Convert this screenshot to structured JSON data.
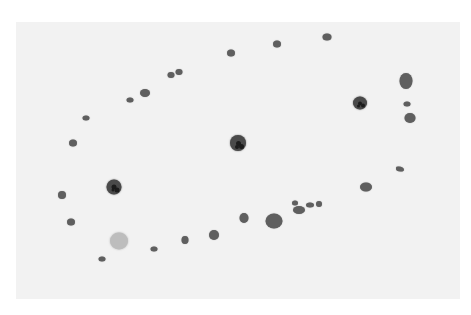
{
  "image": {
    "description": "Grayscale micrograph-style panel with scattered round cells/particles on a light gray background, surrounded by a white margin",
    "background_color": "#ffffff",
    "panel": {
      "x": 16,
      "y": 22,
      "width": 444,
      "height": 277,
      "color": "#f2f2f2"
    },
    "colors": {
      "dark_blob": "#5f5f5f",
      "nucleated_cell": "#4a4a4a",
      "nucleus": "#1c1c1c",
      "light_cell": "#bdbdbd"
    },
    "blobs": [
      {
        "x": 327,
        "y": 37,
        "w": 9,
        "h": 7,
        "kind": "dot"
      },
      {
        "x": 277,
        "y": 44,
        "w": 8,
        "h": 7,
        "kind": "dot"
      },
      {
        "x": 231,
        "y": 53,
        "w": 8,
        "h": 7,
        "kind": "dot"
      },
      {
        "x": 171,
        "y": 75,
        "w": 7,
        "h": 6,
        "kind": "dot"
      },
      {
        "x": 179,
        "y": 72,
        "w": 7,
        "h": 6,
        "kind": "dot"
      },
      {
        "x": 145,
        "y": 93,
        "w": 10,
        "h": 8,
        "kind": "dot"
      },
      {
        "x": 130,
        "y": 100,
        "w": 7,
        "h": 5,
        "kind": "dot"
      },
      {
        "x": 86,
        "y": 118,
        "w": 7,
        "h": 5,
        "kind": "dot"
      },
      {
        "x": 73,
        "y": 143,
        "w": 8,
        "h": 7,
        "kind": "dot"
      },
      {
        "x": 238,
        "y": 143,
        "w": 16,
        "h": 16,
        "kind": "nucleated"
      },
      {
        "x": 360,
        "y": 103,
        "w": 14,
        "h": 13,
        "kind": "nucleated"
      },
      {
        "x": 406,
        "y": 81,
        "w": 13,
        "h": 16,
        "kind": "dot"
      },
      {
        "x": 407,
        "y": 104,
        "w": 7,
        "h": 5,
        "kind": "dot"
      },
      {
        "x": 410,
        "y": 118,
        "w": 11,
        "h": 10,
        "kind": "dot"
      },
      {
        "x": 400,
        "y": 169,
        "w": 8,
        "h": 5,
        "kind": "triangle"
      },
      {
        "x": 366,
        "y": 187,
        "w": 12,
        "h": 9,
        "kind": "dot"
      },
      {
        "x": 114,
        "y": 187,
        "w": 15,
        "h": 15,
        "kind": "nucleated"
      },
      {
        "x": 62,
        "y": 195,
        "w": 8,
        "h": 8,
        "kind": "dot"
      },
      {
        "x": 71,
        "y": 222,
        "w": 8,
        "h": 7,
        "kind": "dot"
      },
      {
        "x": 119,
        "y": 241,
        "w": 18,
        "h": 17,
        "kind": "light"
      },
      {
        "x": 102,
        "y": 259,
        "w": 7,
        "h": 5,
        "kind": "dot"
      },
      {
        "x": 154,
        "y": 249,
        "w": 7,
        "h": 5,
        "kind": "dot"
      },
      {
        "x": 185,
        "y": 240,
        "w": 7,
        "h": 8,
        "kind": "dot"
      },
      {
        "x": 214,
        "y": 235,
        "w": 10,
        "h": 10,
        "kind": "dot"
      },
      {
        "x": 244,
        "y": 218,
        "w": 9,
        "h": 10,
        "kind": "dot"
      },
      {
        "x": 274,
        "y": 221,
        "w": 17,
        "h": 15,
        "kind": "dot"
      },
      {
        "x": 295,
        "y": 203,
        "w": 6,
        "h": 5,
        "kind": "dot"
      },
      {
        "x": 299,
        "y": 210,
        "w": 12,
        "h": 8,
        "kind": "dot"
      },
      {
        "x": 310,
        "y": 205,
        "w": 8,
        "h": 5,
        "kind": "dot"
      },
      {
        "x": 319,
        "y": 204,
        "w": 6,
        "h": 6,
        "kind": "dot"
      }
    ]
  }
}
